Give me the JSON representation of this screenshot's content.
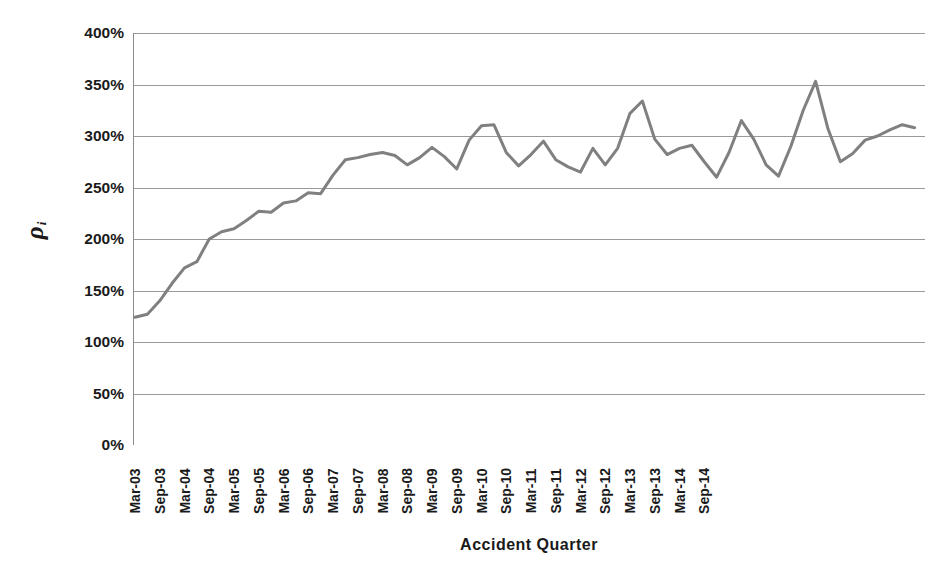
{
  "chart_data": {
    "type": "line",
    "title": "",
    "xlabel": "Accident Quarter",
    "ylabel": "ρi",
    "ylabel_symbol": "ρ",
    "ylabel_subscript": "i",
    "ylim": [
      0,
      400
    ],
    "ytick_values": [
      0,
      50,
      100,
      150,
      200,
      250,
      300,
      350,
      400
    ],
    "ytick_labels": [
      "0%",
      "50%",
      "100%",
      "150%",
      "200%",
      "250%",
      "300%",
      "350%",
      "400%"
    ],
    "grid": true,
    "grid_axis": "y",
    "legend": false,
    "legend_position": "none",
    "line_color": "#808080",
    "line_width": 3,
    "x_tick_label_interval": 2,
    "categories": [
      "Mar-03",
      "Jun-03",
      "Sep-03",
      "Dec-03",
      "Mar-04",
      "Jun-04",
      "Sep-04",
      "Dec-04",
      "Mar-05",
      "Jun-05",
      "Sep-05",
      "Dec-05",
      "Mar-06",
      "Jun-06",
      "Sep-06",
      "Dec-06",
      "Mar-07",
      "Jun-07",
      "Sep-07",
      "Dec-07",
      "Mar-08",
      "Jun-08",
      "Sep-08",
      "Dec-08",
      "Mar-09",
      "Jun-09",
      "Sep-09",
      "Dec-09",
      "Mar-10",
      "Jun-10",
      "Sep-10",
      "Dec-10",
      "Mar-11",
      "Jun-11",
      "Sep-11",
      "Dec-11",
      "Mar-12",
      "Jun-12",
      "Sep-12",
      "Dec-12",
      "Mar-13",
      "Jun-13",
      "Sep-13",
      "Dec-13",
      "Mar-14",
      "Jun-14",
      "Sep-14",
      "Dec-14"
    ],
    "tick_labels_shown": [
      "Mar-03",
      "Sep-03",
      "Mar-04",
      "Sep-04",
      "Mar-05",
      "Sep-05",
      "Mar-06",
      "Sep-06",
      "Mar-07",
      "Sep-07",
      "Mar-08",
      "Sep-08",
      "Mar-09",
      "Sep-09",
      "Mar-10",
      "Sep-10",
      "Mar-11",
      "Sep-11",
      "Mar-12",
      "Sep-12",
      "Mar-13",
      "Sep-13",
      "Mar-14",
      "Sep-14"
    ],
    "values": [
      124,
      127,
      140,
      157,
      172,
      178,
      200,
      207,
      210,
      218,
      227,
      226,
      235,
      237,
      245,
      244,
      262,
      277,
      279,
      282,
      284,
      281,
      272,
      279,
      289,
      280,
      268,
      296,
      310,
      311,
      284,
      271,
      282,
      295,
      277,
      270,
      265,
      288,
      272,
      288,
      322,
      334,
      297,
      282,
      288,
      291,
      275,
      260
    ],
    "values_tail": [
      284,
      315,
      297,
      272,
      261,
      290,
      325,
      353,
      307,
      275,
      283,
      296,
      300,
      306,
      311,
      308
    ],
    "series_name": "rho_i"
  },
  "axes": {
    "x_title": "Accident Quarter",
    "y_title_glyph": "ρ",
    "y_title_sub": "i"
  }
}
